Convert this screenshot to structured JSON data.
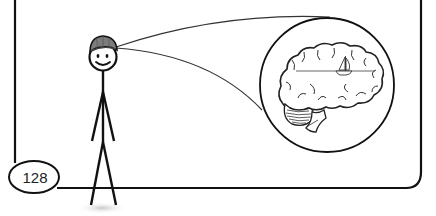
{
  "illustration": {
    "description": "Stick figure wearing a gray cap, with lines from head to a magnified circle showing a brain containing a sailboat on a horizon line",
    "page_number": "128",
    "colors": {
      "ink": "#111111",
      "cap": "#7a7a7a",
      "cap_brim": "#555555",
      "shadow": "#d4d4d4",
      "background": "#ffffff",
      "cerebellum_hatch": "#333333"
    },
    "elements": {
      "figure": "stick-figure-with-cap",
      "magnifier": "brain-magnification-circle",
      "thought": "sailboat-on-horizon"
    }
  }
}
